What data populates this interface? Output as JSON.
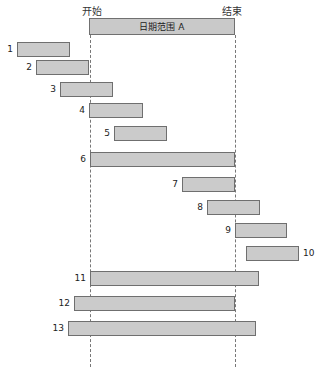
{
  "chart_data": {
    "type": "gantt-diagram",
    "title": "日期范围 A",
    "start_label": "开始",
    "end_label": "结束",
    "range": {
      "start": 90,
      "end": 235
    },
    "bars": [
      {
        "id": "1",
        "x0": 17,
        "x1": 70,
        "y": 42
      },
      {
        "id": "2",
        "x0": 36,
        "x1": 89,
        "y": 60
      },
      {
        "id": "3",
        "x0": 60,
        "x1": 113,
        "y": 82
      },
      {
        "id": "4",
        "x0": 89,
        "x1": 143,
        "y": 103
      },
      {
        "id": "5",
        "x0": 114,
        "x1": 167,
        "y": 126
      },
      {
        "id": "6",
        "x0": 90,
        "x1": 235,
        "y": 152
      },
      {
        "id": "7",
        "x0": 182,
        "x1": 235,
        "y": 177
      },
      {
        "id": "8",
        "x0": 207,
        "x1": 260,
        "y": 200
      },
      {
        "id": "9",
        "x0": 235,
        "x1": 287,
        "y": 223
      },
      {
        "id": "10",
        "x0": 246,
        "x1": 299,
        "y": 246,
        "label_right": true
      },
      {
        "id": "11",
        "x0": 90,
        "x1": 259,
        "y": 271
      },
      {
        "id": "12",
        "x0": 74,
        "x1": 235,
        "y": 296
      },
      {
        "id": "13",
        "x0": 68,
        "x1": 256,
        "y": 321
      }
    ]
  }
}
